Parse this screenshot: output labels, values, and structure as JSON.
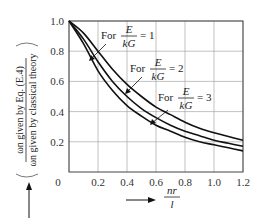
{
  "chart_data": {
    "type": "line",
    "title": "",
    "xlabel": "nr/l",
    "xlabel_parts": {
      "numerator": "nr",
      "denominator": "l"
    },
    "ylabel": "ωn given by Eq. (E.4) / ωn given by classical theory",
    "ylabel_parts": {
      "numerator": "ωn given by Eq. (E.4)",
      "denominator": "ωn given by classical theory"
    },
    "xlim": [
      0,
      1.2
    ],
    "ylim": [
      0,
      1.0
    ],
    "x_ticks": [
      "0",
      "0.2",
      "0.4",
      "0.6",
      "0.8",
      "1.0",
      "1.2"
    ],
    "y_ticks": [
      "0.2",
      "0.4",
      "0.6",
      "0.8",
      "1.0"
    ],
    "grid": true,
    "x": [
      0,
      0.1,
      0.2,
      0.3,
      0.4,
      0.5,
      0.6,
      0.7,
      0.8,
      0.9,
      1.0,
      1.1,
      1.2
    ],
    "series": [
      {
        "name": "For E/kG = 1",
        "ratio": "1",
        "values": [
          1.0,
          0.92,
          0.8,
          0.68,
          0.58,
          0.5,
          0.43,
          0.38,
          0.33,
          0.29,
          0.26,
          0.235,
          0.21
        ]
      },
      {
        "name": "For E/kG = 2",
        "ratio": "2",
        "values": [
          1.0,
          0.88,
          0.73,
          0.6,
          0.5,
          0.42,
          0.36,
          0.31,
          0.27,
          0.24,
          0.21,
          0.19,
          0.17
        ]
      },
      {
        "name": "For E/kG = 3",
        "ratio": "3",
        "values": [
          1.0,
          0.85,
          0.67,
          0.54,
          0.44,
          0.37,
          0.31,
          0.27,
          0.23,
          0.2,
          0.18,
          0.16,
          0.14
        ]
      }
    ],
    "annotations": [
      {
        "text": "For",
        "frac_num": "E",
        "frac_den": "kG",
        "eq": "= 1"
      },
      {
        "text": "For",
        "frac_num": "E",
        "frac_den": "kG",
        "eq": "= 2"
      },
      {
        "text": "For",
        "frac_num": "E",
        "frac_den": "kG",
        "eq": "= 3"
      }
    ],
    "legend_position": "inline annotations"
  },
  "colors": {
    "curve": "#111111",
    "grid": "#999999",
    "axis": "#444444"
  }
}
